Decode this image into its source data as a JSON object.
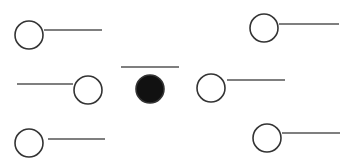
{
  "diagram": {
    "background": "#ffffff",
    "stroke_color": "#333333",
    "line_color": "#555555",
    "fill_color": "#111111",
    "nodes": [
      {
        "id": "top-left",
        "cx": 29,
        "cy": 35,
        "r": 14,
        "filled": false,
        "line": {
          "x1": 44,
          "y1": 30,
          "x2": 102,
          "y2": 30
        }
      },
      {
        "id": "top-right",
        "cx": 264,
        "cy": 28,
        "r": 14,
        "filled": false,
        "line": {
          "x1": 279,
          "y1": 24,
          "x2": 339,
          "y2": 24
        }
      },
      {
        "id": "middle-left",
        "cx": 88,
        "cy": 90,
        "r": 14,
        "filled": false,
        "line": {
          "x1": 17,
          "y1": 84,
          "x2": 73,
          "y2": 84
        }
      },
      {
        "id": "center",
        "cx": 150,
        "cy": 89,
        "r": 14,
        "filled": true,
        "line": {
          "x1": 121,
          "y1": 67,
          "x2": 179,
          "y2": 67
        }
      },
      {
        "id": "middle-right",
        "cx": 211,
        "cy": 88,
        "r": 14,
        "filled": false,
        "line": {
          "x1": 227,
          "y1": 80,
          "x2": 285,
          "y2": 80
        }
      },
      {
        "id": "bottom-left",
        "cx": 29,
        "cy": 143,
        "r": 14,
        "filled": false,
        "line": {
          "x1": 48,
          "y1": 139,
          "x2": 105,
          "y2": 139
        }
      },
      {
        "id": "bottom-right",
        "cx": 267,
        "cy": 138,
        "r": 14,
        "filled": false,
        "line": {
          "x1": 282,
          "y1": 133,
          "x2": 340,
          "y2": 133
        }
      }
    ]
  }
}
